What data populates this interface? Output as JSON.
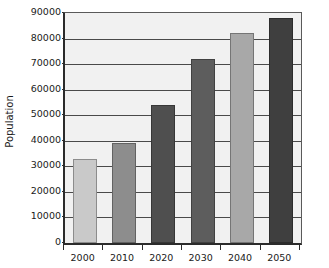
{
  "chart_data": {
    "type": "bar",
    "title": "",
    "xlabel": "",
    "ylabel": "Population",
    "categories": [
      "2000",
      "2010",
      "2020",
      "2030",
      "2040",
      "2050"
    ],
    "values": [
      33000,
      39000,
      54000,
      72000,
      82000,
      88000
    ],
    "bar_colors": [
      "#c9c9c9",
      "#8d8d8d",
      "#4f4f4f",
      "#5d5d5d",
      "#a8a8a8",
      "#3f3f3f"
    ],
    "ylim": [
      0,
      90000
    ],
    "ytick_values": [
      0,
      10000,
      20000,
      30000,
      40000,
      50000,
      60000,
      70000,
      80000,
      90000
    ],
    "ytick_labels": [
      "0",
      "10000",
      "20000",
      "30000",
      "40000",
      "50000",
      "60000",
      "70000",
      "80000",
      "90000"
    ],
    "grid": true,
    "grid_axis": "y",
    "legend": false,
    "plot_background": "#f1f1f1",
    "axis_color": "#2b2b2b",
    "gridline_color": "#4a4a4a",
    "text_color": "#1a1a1a"
  }
}
